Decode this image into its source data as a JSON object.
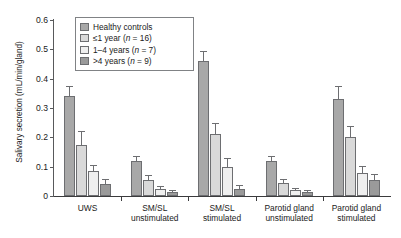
{
  "chart_data": {
    "type": "bar",
    "title": "",
    "subtitle": "",
    "xlabel": "",
    "ylabel": "Salivary secretion (mL/min/gland)",
    "ylim": [
      0,
      0.6
    ],
    "ytick_labels": [
      "0",
      "0.1",
      "0.2",
      "0.3",
      "0.4",
      "0.5",
      "0.6"
    ],
    "ytick_values": [
      0,
      0.1,
      0.2,
      0.3,
      0.4,
      0.5,
      0.6
    ],
    "grid": false,
    "legend_position": "top-left-inside",
    "categories": [
      "UWS",
      "SM/SL\nunstimulated",
      "SM/SL\nstimulated",
      "Parotid gland\nunstimulated",
      "Parotid gland\nstimulated"
    ],
    "series": [
      {
        "name": "Healthy controls",
        "color": "#a8a8a8",
        "values": [
          0.34,
          0.12,
          0.46,
          0.12,
          0.33
        ],
        "errors": [
          0.035,
          0.017,
          0.035,
          0.016,
          0.045
        ]
      },
      {
        "name": "≤1 year (n = 16)",
        "color": "#d9d9d9",
        "values": [
          0.175,
          0.055,
          0.21,
          0.045,
          0.2
        ],
        "errors": [
          0.045,
          0.015,
          0.04,
          0.013,
          0.04
        ]
      },
      {
        "name": "1–4 years (n = 7)",
        "color": "#efefef",
        "values": [
          0.085,
          0.025,
          0.1,
          0.02,
          0.08
        ],
        "errors": [
          0.022,
          0.009,
          0.028,
          0.008,
          0.023
        ]
      },
      {
        "name": ">4 years (n = 9)",
        "color": "#9a9a9a",
        "values": [
          0.04,
          0.015,
          0.025,
          0.013,
          0.055
        ],
        "errors": [
          0.017,
          0.007,
          0.012,
          0.006,
          0.02
        ]
      }
    ]
  },
  "legend": {
    "entries": [
      {
        "label_plain": "Healthy controls",
        "label_html": "Healthy controls"
      },
      {
        "label_plain": "≤1 year (n = 16)",
        "label_html": "≤1 year (<i>n</i> = 16)"
      },
      {
        "label_plain": "1–4 years (n = 7)",
        "label_html": "1–4 years (<i>n</i> = 7)"
      },
      {
        "label_plain": ">4 years (n = 9)",
        "label_html": ">4 years (<i>n</i> = 9)"
      }
    ]
  }
}
